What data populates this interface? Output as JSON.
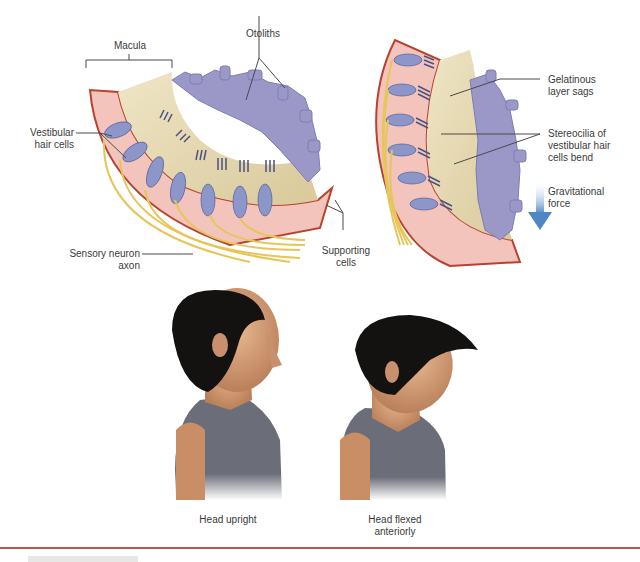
{
  "figure": {
    "top_left_panel": {
      "title": "Macula",
      "labels": {
        "macula": "Macula",
        "otoliths": "Otoliths",
        "vestibular_hair_cells": "Vestibular\nhair cells",
        "sensory_neuron_axon": "Sensory neuron\naxon",
        "supporting_cells": "Supporting\ncells"
      }
    },
    "top_right_panel": {
      "labels": {
        "gelatinous_layer": "Gelatinous\nlayer sags",
        "stereocilia": "Stereocilia of\nvestibular hair\ncells bend",
        "gravitational_force": "Gravitational\nforce"
      }
    },
    "bottom_panel": {
      "captions": {
        "head_upright": "Head upright",
        "head_flexed": "Head flexed\nanteriorly"
      }
    },
    "colors": {
      "epithelium": "#f2c4bb",
      "membrane_edge": "#b8412f",
      "hair_cell": "#8c96c8",
      "gel_layer": "#e8dcb8",
      "otolith": "#9b98c8",
      "axon": "#e6c65a",
      "arrow": "#5b8fc7",
      "hair": "#141210",
      "skin": "#d9a27a",
      "shirt": "#6b6e78",
      "divider": "#b05a4a",
      "label_text": "#3a3a3a",
      "leader_line": "#4a4a4a"
    }
  }
}
